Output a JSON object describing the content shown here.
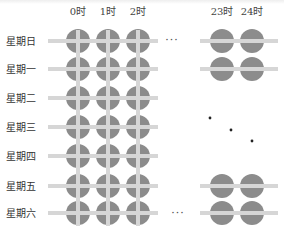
{
  "diagram": {
    "title": "",
    "column_labels_left": [
      "0时",
      "1时",
      "2时"
    ],
    "column_labels_right": [
      "23时",
      "24时"
    ],
    "row_labels": [
      "星期日",
      "星期一",
      "星期二",
      "星期三",
      "星期四",
      "星期五",
      "星期六"
    ],
    "ellipsis": "···",
    "rows_with_right_group": [
      0,
      1,
      5,
      6
    ],
    "rows_with_ellipsis": [
      0,
      6
    ],
    "vertical_ellipsis_dots": 3,
    "colors": {
      "node": "#8c8c8c",
      "connector": "#d6d6d6",
      "text": "#333333",
      "dot": "#222222"
    }
  }
}
